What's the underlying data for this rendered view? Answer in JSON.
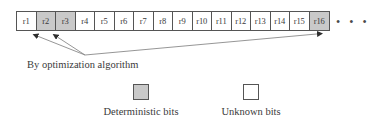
{
  "figure": {
    "register_strip": {
      "cells": [
        {
          "label": "r1",
          "state": "unknown"
        },
        {
          "label": "r2",
          "state": "deterministic"
        },
        {
          "label": "r3",
          "state": "deterministic"
        },
        {
          "label": "r4",
          "state": "unknown"
        },
        {
          "label": "r5",
          "state": "unknown"
        },
        {
          "label": "r6",
          "state": "unknown"
        },
        {
          "label": "r7",
          "state": "unknown"
        },
        {
          "label": "r8",
          "state": "unknown"
        },
        {
          "label": "r9",
          "state": "unknown"
        },
        {
          "label": "r10",
          "state": "unknown"
        },
        {
          "label": "r11",
          "state": "unknown"
        },
        {
          "label": "r12",
          "state": "unknown"
        },
        {
          "label": "r13",
          "state": "unknown"
        },
        {
          "label": "r14",
          "state": "unknown"
        },
        {
          "label": "r15",
          "state": "unknown"
        },
        {
          "label": "r16",
          "state": "deterministic"
        }
      ],
      "continuation": "• • •"
    },
    "annotation": {
      "caption": "By optimization algorithm",
      "pointed_cells": [
        "r2",
        "r3",
        "r16"
      ]
    },
    "legend": {
      "deterministic": {
        "label": "Deterministic bits",
        "swatch": "filled-square",
        "color": "#c9c9c9"
      },
      "unknown": {
        "label": "Unknown bits",
        "swatch": "empty-square",
        "color": "#ffffff"
      }
    },
    "colors": {
      "shaded_cell": "#c9c9c9",
      "unshaded_cell": "#ffffff",
      "outline": "#555555",
      "text": "#3a3a3a",
      "connector_line": "#8a8a8a"
    }
  }
}
